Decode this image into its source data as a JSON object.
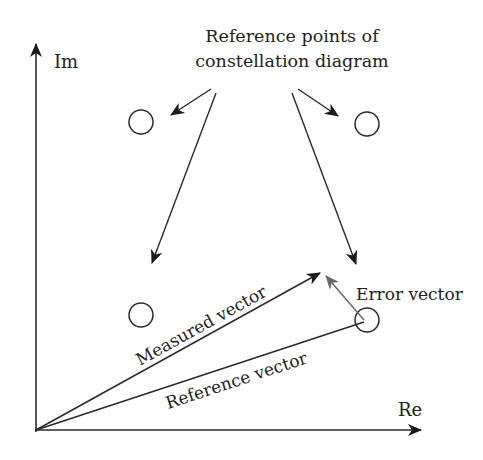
{
  "diagram": {
    "title_line1": "Reference points of",
    "title_line2": "constellation diagram",
    "axes": {
      "imag_label": "Im",
      "real_label": "Re"
    },
    "vectors": {
      "measured_label": "Measured vector",
      "reference_label": "Reference vector",
      "error_label": "Error vector"
    },
    "reference_points": [
      {
        "name": "top-left",
        "cx": 141,
        "cy": 122
      },
      {
        "name": "top-right",
        "cx": 367,
        "cy": 124
      },
      {
        "name": "bottom-left",
        "cx": 141,
        "cy": 315
      },
      {
        "name": "bottom-right",
        "cx": 367,
        "cy": 320
      }
    ],
    "colors": {
      "line": "#2a2a2a",
      "error_vector": "#6a6a6a",
      "background": "#ffffff"
    }
  }
}
